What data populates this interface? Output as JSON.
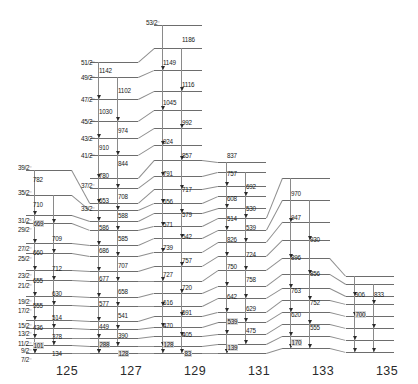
{
  "figure": {
    "type": "nuclear-level-scheme",
    "title": "",
    "background": "#ffffff",
    "level_color": "#6d6d6d",
    "transition_color": "#8a8a8a",
    "width": 418,
    "height": 384
  },
  "spin_labels": [
    {
      "text": "53/2⁻",
      "x": 146,
      "y": 19
    },
    {
      "text": "51/2⁻",
      "x": 81,
      "y": 59
    },
    {
      "text": "49/2⁻",
      "x": 81,
      "y": 74
    },
    {
      "text": "47/2⁻",
      "x": 81,
      "y": 96
    },
    {
      "text": "45/2⁻",
      "x": 81,
      "y": 118
    },
    {
      "text": "43/2⁻",
      "x": 81,
      "y": 135
    },
    {
      "text": "41/2⁻",
      "x": 81,
      "y": 152
    },
    {
      "text": "39/2⁻",
      "x": 18,
      "y": 164
    },
    {
      "text": "37/2⁻",
      "x": 81,
      "y": 182
    },
    {
      "text": "35/2⁻",
      "x": 18,
      "y": 189
    },
    {
      "text": "33/2⁻",
      "x": 81,
      "y": 205
    },
    {
      "text": "31/2⁻",
      "x": 18,
      "y": 217
    },
    {
      "text": "29/2⁻",
      "x": 18,
      "y": 226
    },
    {
      "text": "27/2⁻",
      "x": 18,
      "y": 245
    },
    {
      "text": "25/2⁻",
      "x": 18,
      "y": 255
    },
    {
      "text": "23/2⁻",
      "x": 18,
      "y": 272
    },
    {
      "text": "21/2⁻",
      "x": 18,
      "y": 282
    },
    {
      "text": "19/2⁻",
      "x": 18,
      "y": 298
    },
    {
      "text": "17/2⁻",
      "x": 18,
      "y": 307
    },
    {
      "text": "15/2⁻",
      "x": 18,
      "y": 322
    },
    {
      "text": "13/2⁻",
      "x": 18,
      "y": 330
    },
    {
      "text": "11/2⁻",
      "x": 18,
      "y": 340
    },
    {
      "text": "9/2⁻",
      "x": 21,
      "y": 347
    },
    {
      "text": "7/2⁻",
      "x": 21,
      "y": 356
    }
  ],
  "isotopes": [
    {
      "mass": "125",
      "x": 56,
      "y": 364
    },
    {
      "mass": "127",
      "x": 120,
      "y": 364
    },
    {
      "mass": "129",
      "x": 184,
      "y": 364
    },
    {
      "mass": "131",
      "x": 248,
      "y": 364
    },
    {
      "mass": "133",
      "x": 312,
      "y": 364
    },
    {
      "mass": "135",
      "x": 376,
      "y": 364
    }
  ],
  "energies_125": [
    {
      "e": "782",
      "x": 33,
      "y": 176
    },
    {
      "e": "710",
      "x": 33,
      "y": 201
    },
    {
      "e": "669",
      "x": 33,
      "y": 220,
      "boxed": true
    },
    {
      "e": "709",
      "x": 52,
      "y": 235
    },
    {
      "e": "660",
      "x": 33,
      "y": 249
    },
    {
      "e": "712",
      "x": 52,
      "y": 265
    },
    {
      "e": "655",
      "x": 33,
      "y": 277
    },
    {
      "e": "630",
      "x": 52,
      "y": 290
    },
    {
      "e": "555",
      "x": 33,
      "y": 302
    },
    {
      "e": "514",
      "x": 52,
      "y": 314
    },
    {
      "e": "436",
      "x": 33,
      "y": 324
    },
    {
      "e": "378",
      "x": 52,
      "y": 333
    },
    {
      "e": "101",
      "x": 33,
      "y": 342,
      "boxed": true
    },
    {
      "e": "134",
      "x": 52,
      "y": 350
    }
  ],
  "energies_127": [
    {
      "e": "1142",
      "x": 99,
      "y": 67
    },
    {
      "e": "1102",
      "x": 118,
      "y": 87
    },
    {
      "e": "1030",
      "x": 99,
      "y": 108
    },
    {
      "e": "974",
      "x": 118,
      "y": 127
    },
    {
      "e": "910",
      "x": 99,
      "y": 144
    },
    {
      "e": "844",
      "x": 118,
      "y": 160
    },
    {
      "e": "780",
      "x": 99,
      "y": 172
    },
    {
      "e": "708",
      "x": 118,
      "y": 193
    },
    {
      "e": "653",
      "x": 99,
      "y": 197
    },
    {
      "e": "588",
      "x": 118,
      "y": 212
    },
    {
      "e": "586",
      "x": 99,
      "y": 224
    },
    {
      "e": "585",
      "x": 118,
      "y": 235
    },
    {
      "e": "686",
      "x": 99,
      "y": 247
    },
    {
      "e": "707",
      "x": 118,
      "y": 262
    },
    {
      "e": "677",
      "x": 99,
      "y": 275
    },
    {
      "e": "658",
      "x": 118,
      "y": 288
    },
    {
      "e": "577",
      "x": 99,
      "y": 300
    },
    {
      "e": "541",
      "x": 118,
      "y": 312
    },
    {
      "e": "449",
      "x": 99,
      "y": 323
    },
    {
      "e": "390",
      "x": 118,
      "y": 332
    },
    {
      "e": "288",
      "x": 99,
      "y": 341,
      "boxed": true
    },
    {
      "e": "128",
      "x": 118,
      "y": 350,
      "boxed": true
    }
  ],
  "energies_129": [
    {
      "e": "1186",
      "x": 182,
      "y": 36
    },
    {
      "e": "1149",
      "x": 163,
      "y": 59
    },
    {
      "e": "1116",
      "x": 182,
      "y": 81
    },
    {
      "e": "1045",
      "x": 163,
      "y": 99
    },
    {
      "e": "992",
      "x": 182,
      "y": 119
    },
    {
      "e": "924",
      "x": 163,
      "y": 138
    },
    {
      "e": "857",
      "x": 182,
      "y": 152
    },
    {
      "e": "791",
      "x": 163,
      "y": 170
    },
    {
      "e": "717",
      "x": 182,
      "y": 186
    },
    {
      "e": "656",
      "x": 163,
      "y": 198
    },
    {
      "e": "579",
      "x": 182,
      "y": 211
    },
    {
      "e": "571",
      "x": 163,
      "y": 221
    },
    {
      "e": "542",
      "x": 182,
      "y": 233
    },
    {
      "e": "739",
      "x": 163,
      "y": 244
    },
    {
      "e": "757",
      "x": 182,
      "y": 257
    },
    {
      "e": "727",
      "x": 163,
      "y": 271
    },
    {
      "e": "720",
      "x": 182,
      "y": 284
    },
    {
      "e": "616",
      "x": 163,
      "y": 299
    },
    {
      "e": "591",
      "x": 182,
      "y": 309
    },
    {
      "e": "470",
      "x": 163,
      "y": 322
    },
    {
      "e": "405",
      "x": 182,
      "y": 331
    },
    {
      "e": "128",
      "x": 163,
      "y": 341,
      "boxed": true
    },
    {
      "e": "83",
      "x": 184,
      "y": 350,
      "boxed": true
    }
  ],
  "energies_131": [
    {
      "e": "837",
      "x": 227,
      "y": 152
    },
    {
      "e": "757",
      "x": 227,
      "y": 170
    },
    {
      "e": "692",
      "x": 246,
      "y": 183
    },
    {
      "e": "608",
      "x": 227,
      "y": 195
    },
    {
      "e": "530",
      "x": 246,
      "y": 205
    },
    {
      "e": "514",
      "x": 227,
      "y": 215
    },
    {
      "e": "539",
      "x": 246,
      "y": 224
    },
    {
      "e": "826",
      "x": 227,
      "y": 236
    },
    {
      "e": "724",
      "x": 246,
      "y": 251
    },
    {
      "e": "750",
      "x": 227,
      "y": 263
    },
    {
      "e": "758",
      "x": 246,
      "y": 276
    },
    {
      "e": "642",
      "x": 227,
      "y": 293
    },
    {
      "e": "629",
      "x": 246,
      "y": 305
    },
    {
      "e": "539",
      "x": 227,
      "y": 318,
      "boxed": true
    },
    {
      "e": "475",
      "x": 246,
      "y": 327
    },
    {
      "e": "139",
      "x": 227,
      "y": 344,
      "boxed": true
    }
  ],
  "energies_133": [
    {
      "e": "970",
      "x": 291,
      "y": 190
    },
    {
      "e": "947",
      "x": 291,
      "y": 214
    },
    {
      "e": "930",
      "x": 310,
      "y": 236
    },
    {
      "e": "896",
      "x": 291,
      "y": 254
    },
    {
      "e": "856",
      "x": 310,
      "y": 270
    },
    {
      "e": "763",
      "x": 291,
      "y": 287
    },
    {
      "e": "752",
      "x": 310,
      "y": 299
    },
    {
      "e": "620",
      "x": 291,
      "y": 311
    },
    {
      "e": "555",
      "x": 310,
      "y": 324
    },
    {
      "e": "170",
      "x": 291,
      "y": 339,
      "boxed": true
    }
  ],
  "energies_135": [
    {
      "e": "906",
      "x": 355,
      "y": 291
    },
    {
      "e": "833",
      "x": 374,
      "y": 291
    },
    {
      "e": "700",
      "x": 355,
      "y": 311,
      "boxed": true
    }
  ]
}
